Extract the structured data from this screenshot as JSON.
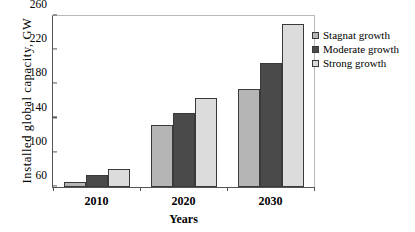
{
  "chart_data": {
    "type": "bar",
    "title": "",
    "xlabel": "Years",
    "ylabel": "Installed  global  capacity,  GW",
    "categories": [
      "2010",
      "2020",
      "2030"
    ],
    "ylim": [
      60,
      260
    ],
    "yticks": [
      60,
      100,
      140,
      180,
      220,
      260
    ],
    "grid": false,
    "legend_position": "right",
    "series": [
      {
        "name": "Stagnat growth",
        "color": "#b5b5b5",
        "values": [
          66,
          133,
          175
        ]
      },
      {
        "name": "Moderate growth",
        "color": "#4a4a4a",
        "values": [
          74,
          147,
          205
        ]
      },
      {
        "name": "Strong growth",
        "color": "#dcdcdc",
        "values": [
          81,
          164,
          251
        ]
      }
    ]
  }
}
